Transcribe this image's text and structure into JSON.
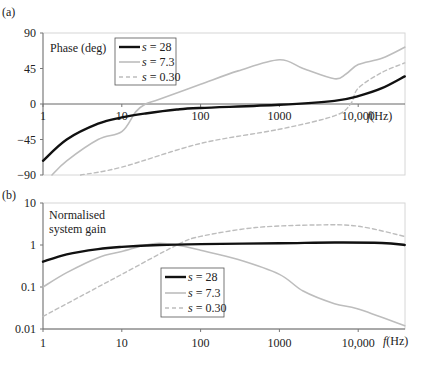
{
  "chart_data": [
    {
      "panel_label": "(a)",
      "type": "line",
      "title": "Phase (deg)",
      "xlabel": "f(Hz)",
      "xscale": "log",
      "xlim": [
        1,
        39000
      ],
      "ylim": [
        -90,
        90
      ],
      "xticks": [
        "1",
        "10",
        "100",
        "1000",
        "10,000"
      ],
      "yticks": [
        "90",
        "45",
        "0",
        "-45",
        "-90"
      ],
      "legend_position": "upper-left inside",
      "series": [
        {
          "name": "s = 28",
          "style": "solid-black-thick",
          "x": [
            1,
            2,
            5,
            10,
            20,
            50,
            100,
            1000,
            5000,
            10000,
            20000,
            39000
          ],
          "values": [
            -72,
            -45,
            -25,
            -17,
            -12,
            -7,
            -5,
            -1,
            4,
            10,
            20,
            35
          ]
        },
        {
          "name": "s = 7.3",
          "style": "solid-grey",
          "x": [
            1.3,
            2,
            5,
            10,
            15,
            20,
            30,
            100,
            300,
            1000,
            2000,
            5000,
            7000,
            10000,
            20000,
            39000
          ],
          "values": [
            -90,
            -72,
            -45,
            -35,
            -10,
            0,
            6,
            25,
            42,
            56,
            45,
            32,
            38,
            50,
            58,
            72
          ]
        },
        {
          "name": "s = 0.30",
          "style": "dashed-grey",
          "x": [
            3,
            10,
            100,
            1000,
            5000,
            8000,
            10000,
            20000,
            39000
          ],
          "values": [
            -90,
            -80,
            -50,
            -32,
            -15,
            0,
            20,
            40,
            52
          ]
        }
      ]
    },
    {
      "panel_label": "(b)",
      "type": "line",
      "title": "Normalised system gain",
      "xlabel": "f(Hz)",
      "xscale": "log",
      "yscale": "log",
      "xlim": [
        1,
        39000
      ],
      "ylim": [
        0.01,
        10
      ],
      "xticks": [
        "1",
        "10",
        "100",
        "1000",
        "10,000"
      ],
      "yticks": [
        "10",
        "1",
        "0.1",
        "0.01"
      ],
      "legend_position": "center",
      "series": [
        {
          "name": "s = 28",
          "style": "solid-black-thick",
          "x": [
            1,
            2,
            5,
            10,
            30,
            100,
            1000,
            5000,
            20000,
            39000
          ],
          "values": [
            0.4,
            0.6,
            0.8,
            0.9,
            1.0,
            1.05,
            1.1,
            1.15,
            1.12,
            1.0
          ]
        },
        {
          "name": "s = 7.3",
          "style": "solid-grey",
          "x": [
            1,
            2,
            5,
            10,
            20,
            30,
            50,
            100,
            300,
            1000,
            2000,
            5000,
            10000,
            39000
          ],
          "values": [
            0.1,
            0.22,
            0.5,
            0.7,
            1.0,
            1.1,
            1.0,
            0.75,
            0.45,
            0.2,
            0.08,
            0.04,
            0.03,
            0.012
          ]
        },
        {
          "name": "s = 0.30",
          "style": "dashed-grey",
          "x": [
            1,
            3,
            10,
            50,
            100,
            500,
            3000,
            10000,
            39000
          ],
          "values": [
            0.02,
            0.06,
            0.2,
            1.0,
            1.6,
            2.6,
            3.0,
            2.8,
            1.6
          ]
        }
      ]
    }
  ],
  "labels": {
    "a": "(a)",
    "b": "(b)",
    "phase_title": "Phase (deg)",
    "gain_title_1": "Normalised",
    "gain_title_2": "system gain",
    "xunit": "(Hz)",
    "xvar": "f",
    "leg1": "= 28",
    "leg2": "= 7.3",
    "leg3": "= 0.30",
    "legvar": "s"
  }
}
